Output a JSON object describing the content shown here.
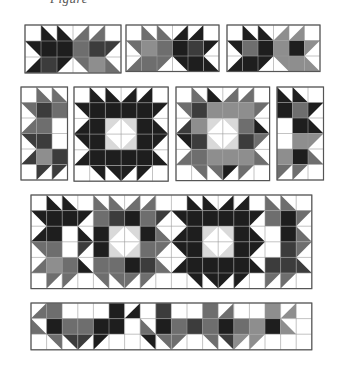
{
  "caption": "Figure",
  "colors": {
    "W": "#ffffff",
    "D": "#1e1e1e",
    "K": "#3c3c3c",
    "M": "#6e6e6e",
    "G": "#8e8e8e",
    "L": "#d9d9d9",
    "grid": "#9a9a9a",
    "border": "#555555"
  },
  "panels": [
    {
      "name": "row1-panel-1",
      "x": 24,
      "y": 24,
      "cell": 16,
      "cols": 6,
      "rows": 3,
      "cells": [
        [
          "W",
          "bl:D",
          "bl:D",
          "br:M",
          "br:M",
          "W"
        ],
        [
          "tr:D",
          "D",
          "D",
          "M",
          "K",
          "tl:K"
        ],
        [
          "br:D",
          "K",
          "tl:D",
          "tr:M",
          "G",
          "bl:M"
        ]
      ]
    },
    {
      "name": "row1-panel-2",
      "x": 125,
      "y": 24,
      "cell": 15.5,
      "cols": 6,
      "rows": 3,
      "cells": [
        [
          "W",
          "bl:M",
          "bl:M",
          "br:D",
          "br:D",
          "W"
        ],
        [
          "tr:M",
          "G",
          "M",
          "D",
          "K",
          "tl:D"
        ],
        [
          "br:M",
          "M",
          "tl:M",
          "tr:D",
          "D",
          "bl:D"
        ]
      ]
    },
    {
      "name": "row1-panel-3",
      "x": 226,
      "y": 24,
      "cell": 15.5,
      "cols": 6,
      "rows": 3,
      "cells": [
        [
          "W",
          "bl:D",
          "bl:D",
          "br:G",
          "br:G",
          "W"
        ],
        [
          "tr:D",
          "M",
          "D",
          "G",
          "D",
          "tl:G"
        ],
        [
          "br:D",
          "D",
          "tl:D",
          "tr:G",
          "G",
          "bl:G"
        ]
      ]
    },
    {
      "name": "row2-panel-a",
      "x": 20,
      "y": 86,
      "cell": 15.5,
      "cols": 3,
      "rows": 6,
      "cells": [
        [
          "W",
          "bl:M",
          "bl:M"
        ],
        [
          "tr:M",
          "K",
          "M"
        ],
        [
          "br:M",
          "M",
          "tl:W"
        ],
        [
          "tr:K",
          "K",
          "bl:W"
        ],
        [
          "br:K",
          "G",
          "K"
        ],
        [
          "W",
          "tl:K",
          "tl:K"
        ]
      ]
    },
    {
      "name": "row2-panel-b",
      "x": 73,
      "y": 86,
      "cell": 15.7,
      "cols": 6,
      "rows": 6,
      "cells": [
        [
          "W",
          "bl:D",
          "bl:D",
          "br:D",
          "br:D",
          "W"
        ],
        [
          "tr:D",
          "D",
          "D",
          "D",
          "D",
          "tl:D"
        ],
        [
          "br:D",
          "D",
          "tl:L",
          "tr:L",
          "D",
          "bl:D"
        ],
        [
          "tr:D",
          "D",
          "bl:L",
          "br:L",
          "D",
          "tl:D"
        ],
        [
          "br:D",
          "D",
          "D",
          "D",
          "D",
          "bl:D"
        ],
        [
          "W",
          "tr:D",
          "tr:D",
          "tl:D",
          "tl:D",
          "W"
        ]
      ]
    },
    {
      "name": "row2-panel-c",
      "x": 175,
      "y": 86,
      "cell": 15.6,
      "cols": 6,
      "rows": 6,
      "cells": [
        [
          "W",
          "bl:M",
          "bl:D",
          "br:M",
          "br:M",
          "W"
        ],
        [
          "tr:M",
          "K",
          "G",
          "G",
          "G",
          "tl:M"
        ],
        [
          "br:K",
          "G",
          "tl:L",
          "tr:L",
          "M",
          "bl:D"
        ],
        [
          "tr:D",
          "K",
          "bl:L",
          "br:L",
          "K",
          "tl:M"
        ],
        [
          "br:M",
          "M",
          "G",
          "G",
          "G",
          "bl:M"
        ],
        [
          "W",
          "tr:M",
          "tr:M",
          "tl:D",
          "tl:M",
          "W"
        ]
      ]
    },
    {
      "name": "row2-panel-d",
      "x": 276,
      "y": 86,
      "cell": 15.5,
      "cols": 3,
      "rows": 6,
      "cells": [
        [
          "bl:D",
          "bl:D",
          "W"
        ],
        [
          "D",
          "M",
          "tl:D"
        ],
        [
          "tr:W",
          "D",
          "bl:D"
        ],
        [
          "br:W",
          "G",
          "tl:G"
        ],
        [
          "G",
          "D",
          "bl:M"
        ],
        [
          "tl:M",
          "tl:M",
          "W"
        ]
      ]
    },
    {
      "name": "row3-panel",
      "x": 30,
      "y": 194,
      "cell": 15.6,
      "cols": 18,
      "rows": 6,
      "cells": [
        [
          "W",
          "bl:D",
          "bl:D",
          "W",
          "bl:M",
          "bl:M",
          "br:M",
          "br:M",
          "W",
          "W",
          "bl:D",
          "bl:D",
          "br:D",
          "br:D",
          "W",
          "bl:M",
          "bl:M",
          "W"
        ],
        [
          "tr:D",
          "D",
          "D",
          "tl:D",
          "M",
          "K",
          "D",
          "M",
          "tl:K",
          "tr:D",
          "D",
          "D",
          "D",
          "D",
          "tl:D",
          "M",
          "D",
          "tl:M"
        ],
        [
          "br:D",
          "D",
          "tl:W",
          "bl:D",
          "D",
          "tl:L",
          "tr:L",
          "D",
          "bl:M",
          "br:D",
          "D",
          "tl:L",
          "tr:L",
          "D",
          "bl:D",
          "tl:W",
          "D",
          "bl:M"
        ],
        [
          "tr:M",
          "M",
          "bl:W",
          "tl:K",
          "D",
          "bl:L",
          "br:L",
          "M",
          "tl:M",
          "tr:D",
          "D",
          "bl:L",
          "br:L",
          "D",
          "tl:D",
          "bl:W",
          "K",
          "tl:M"
        ],
        [
          "br:M",
          "G",
          "M",
          "bl:D",
          "M",
          "M",
          "D",
          "K",
          "bl:M",
          "br:D",
          "D",
          "D",
          "D",
          "D",
          "bl:D",
          "K",
          "K",
          "bl:K"
        ],
        [
          "W",
          "tl:M",
          "tl:M",
          "W",
          "tr:M",
          "tr:M",
          "tl:M",
          "tl:M",
          "W",
          "W",
          "tr:D",
          "tr:D",
          "tl:D",
          "tl:D",
          "W",
          "tl:M",
          "tl:M",
          "W"
        ]
      ]
    },
    {
      "name": "row4-panel",
      "x": 30,
      "y": 302,
      "cell": 15.6,
      "cols": 18,
      "rows": 3,
      "cells": [
        [
          "br:M",
          "M",
          "tl:W",
          "tr:W",
          "W",
          "D",
          "br:D",
          "W",
          "K",
          "tl:W",
          "tr:W",
          "M",
          "br:M",
          "tl:W",
          "tr:W",
          "G",
          "br:G",
          "W"
        ],
        [
          "bl:M",
          "D",
          "M",
          "M",
          "D",
          "D",
          "tl:W",
          "bl:M",
          "D",
          "M",
          "K",
          "M",
          "D",
          "M",
          "G",
          "D",
          "bl:G",
          "W"
        ],
        [
          "W",
          "tr:M",
          "tr:K",
          "tl:K",
          "tl:D",
          "W",
          "W",
          "tr:D",
          "tr:M",
          "tl:M",
          "W",
          "tr:M",
          "tr:K",
          "tl:G",
          "tl:G",
          "W",
          "W",
          "W"
        ]
      ]
    }
  ]
}
